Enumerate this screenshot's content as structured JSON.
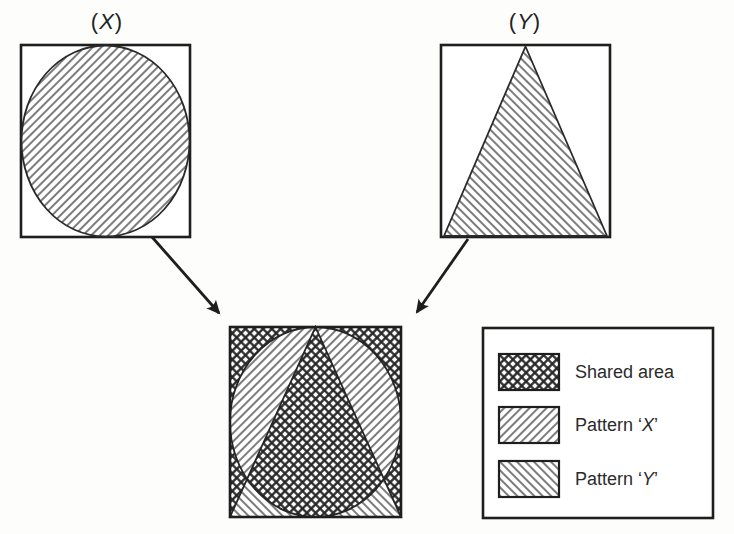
{
  "pictures": {
    "x": {
      "label_prefix": "(",
      "label_symbol": "X",
      "label_suffix": ")",
      "shape": "circle",
      "pattern": "diagonal-up-hatch"
    },
    "y": {
      "label_prefix": "(",
      "label_symbol": "Y",
      "label_suffix": ")",
      "shape": "triangle",
      "pattern": "diagonal-down-hatch"
    },
    "combined": {
      "shapes": "circle-and-triangle-overlay",
      "shared_pattern": "cross-hatch"
    }
  },
  "legend": {
    "items": [
      {
        "swatch": "cross-hatch",
        "label": "Shared area"
      },
      {
        "swatch": "diagonal-up-hatch",
        "label_prefix": "Pattern ‘",
        "label_symbol": "X",
        "label_suffix": "’"
      },
      {
        "swatch": "diagonal-down-hatch",
        "label_prefix": "Pattern ‘",
        "label_symbol": "Y",
        "label_suffix": "’"
      }
    ]
  },
  "colors": {
    "ink": "#1e1e1e",
    "hatch_line": "#444444",
    "cross_line": "#262626",
    "paper": "#fdfdfc"
  }
}
